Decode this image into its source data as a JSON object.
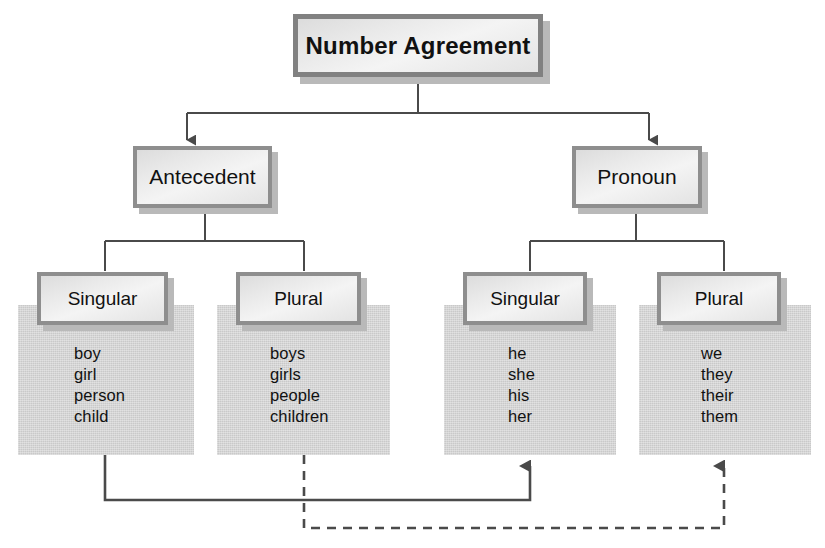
{
  "diagram": {
    "title": "Number Agreement",
    "branches": [
      {
        "id": "antecedent",
        "label": "Antecedent",
        "children": [
          {
            "id": "antecedent-singular",
            "label": "Singular",
            "words": [
              "boy",
              "girl",
              "person",
              "child"
            ]
          },
          {
            "id": "antecedent-plural",
            "label": "Plural",
            "words": [
              "boys",
              "girls",
              "people",
              "children"
            ]
          }
        ]
      },
      {
        "id": "pronoun",
        "label": "Pronoun",
        "children": [
          {
            "id": "pronoun-singular",
            "label": "Singular",
            "words": [
              "he",
              "she",
              "his",
              "her"
            ]
          },
          {
            "id": "pronoun-plural",
            "label": "Plural",
            "words": [
              "we",
              "they",
              "their",
              "them"
            ]
          }
        ]
      }
    ],
    "agreement_links": [
      {
        "id": "singular-agreement",
        "style": "solid",
        "from": "antecedent-singular",
        "to": "pronoun-singular"
      },
      {
        "id": "plural-agreement",
        "style": "dashed",
        "from": "antecedent-plural",
        "to": "pronoun-plural"
      }
    ],
    "colors": {
      "background": "#ffffff",
      "panel_fill": "#c9c9c9",
      "box_border": "#8e8e8e",
      "box_fill": "#eeeeee",
      "shadow": "#b9b9b9",
      "connector": "#4a4a4a",
      "text": "#111111"
    }
  }
}
